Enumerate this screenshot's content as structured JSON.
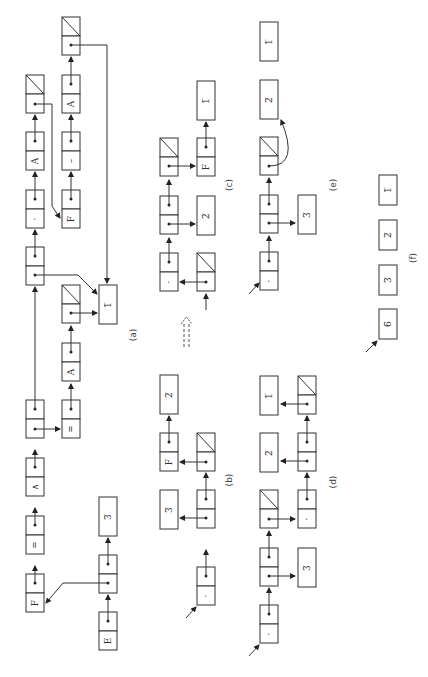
{
  "figure": {
    "orientation": "rotated 90 degrees counter-clockwise",
    "panels": [
      {
        "id": "a",
        "caption": "(a)"
      },
      {
        "id": "b",
        "caption": "(b)"
      },
      {
        "id": "c",
        "caption": "(c)"
      },
      {
        "id": "d",
        "caption": "(d)"
      },
      {
        "id": "e",
        "caption": "(e)"
      },
      {
        "id": "f",
        "caption": "(f)"
      }
    ],
    "transition_arrow": "dashed double arrow",
    "atoms": {
      "F": "F",
      "eq": "=",
      "and": "∧",
      "star": "*",
      "A": "A",
      "minus": "–",
      "E": "E",
      "one": "1̅",
      "two": "2̅",
      "three": "3̅",
      "six": "6̅",
      "dot": "·"
    },
    "panel_a": {
      "main_list": [
        "F",
        "=",
        "∧",
        "(sub)",
        "(→1)",
        "*",
        "A",
        "/"
      ],
      "sub_list_1": [
        "=",
        "A",
        "/"
      ],
      "sub_list_2": [
        "F",
        "–",
        "A",
        "/"
      ],
      "value_box": "1̅",
      "env_list": [
        "E",
        "(→F)",
        "3̅"
      ]
    },
    "panel_b": {
      "values": [
        "3̅",
        "F",
        "2̅"
      ]
    },
    "panel_c": {
      "values": [
        "2̅",
        "F",
        "1̅"
      ]
    },
    "panel_d": {
      "values": [
        "3̅",
        "2̅",
        "1̅"
      ]
    },
    "panel_e": {
      "values": [
        "3̅",
        "2̅",
        "1̅"
      ]
    },
    "panel_f": {
      "values": [
        "6̅",
        "3̅",
        "2̅",
        "1̅"
      ]
    }
  }
}
